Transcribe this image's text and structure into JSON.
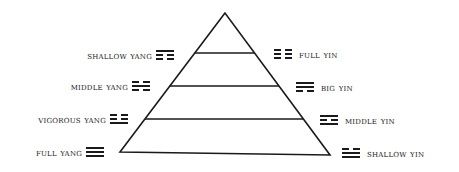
{
  "diagram": {
    "type": "pyramid",
    "stroke_color": "#1a1a1a",
    "pyramid": {
      "apex": [
        225,
        13
      ],
      "base_left": [
        120,
        152
      ],
      "base_right": [
        330,
        155
      ],
      "levels_y": [
        53,
        86,
        119
      ]
    },
    "left_labels": [
      {
        "text": "shallow yang",
        "trigram": [
          "solid",
          "broken",
          "broken"
        ],
        "x_right": 152,
        "y": 49,
        "tri_x": 156,
        "tri_y": 50
      },
      {
        "text": "middle yang",
        "trigram": [
          "broken",
          "solid",
          "broken"
        ],
        "x_right": 128,
        "y": 80,
        "tri_x": 132,
        "tri_y": 81
      },
      {
        "text": "vigorous yang",
        "trigram": [
          "broken",
          "broken",
          "solid"
        ],
        "x_right": 106,
        "y": 113,
        "tri_x": 110,
        "tri_y": 114
      },
      {
        "text": "full yang",
        "trigram": [
          "solid",
          "solid",
          "solid"
        ],
        "x_right": 82,
        "y": 146,
        "tri_x": 86,
        "tri_y": 147
      }
    ],
    "right_labels": [
      {
        "text": "full yin",
        "trigram": [
          "broken",
          "broken",
          "broken"
        ],
        "tri_x": 274,
        "tri_y": 49,
        "x_left": 299,
        "y": 48
      },
      {
        "text": "big yin",
        "trigram": [
          "solid",
          "solid",
          "broken"
        ],
        "tri_x": 296,
        "tri_y": 82,
        "x_left": 321,
        "y": 81
      },
      {
        "text": "middle yin",
        "trigram": [
          "solid",
          "broken",
          "solid"
        ],
        "tri_x": 320,
        "tri_y": 115,
        "x_left": 345,
        "y": 114
      },
      {
        "text": "shallow yin",
        "trigram": [
          "broken",
          "solid",
          "solid"
        ],
        "tri_x": 342,
        "tri_y": 148,
        "x_left": 367,
        "y": 147
      }
    ]
  }
}
